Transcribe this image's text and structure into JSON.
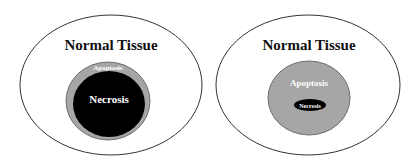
{
  "diagrams": [
    {
      "outer_label": "Normal Tissue",
      "middle_label": "Apoptosis",
      "inner_label": "Necrosis"
    },
    {
      "outer_label": "Normal Tissue",
      "middle_label": "Apoptosis",
      "inner_label": "Necrosis"
    }
  ],
  "colors": {
    "outline": "#333333",
    "apoptosis_fill": "#a6a6a6",
    "necrosis_fill": "#000000",
    "background": "#ffffff"
  }
}
